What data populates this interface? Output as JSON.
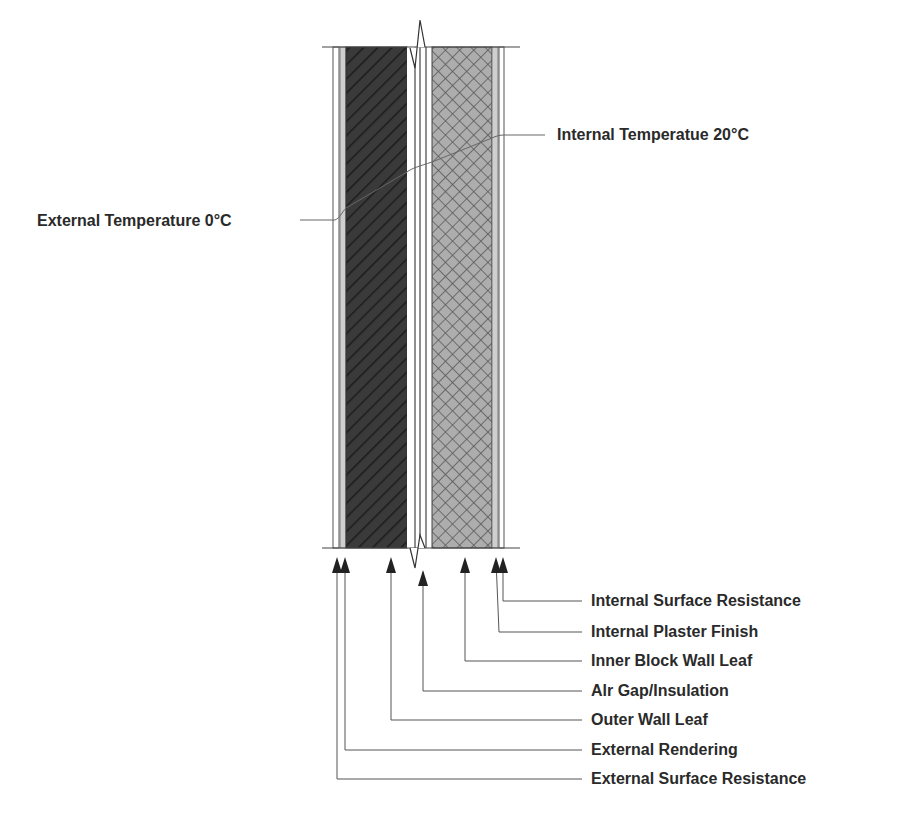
{
  "diagram": {
    "colors": {
      "outline": "#555555",
      "outer_leaf_fill": "#3a3a3a",
      "outer_leaf_hatch": "#222222",
      "inner_block_fill": "#a8a8a8",
      "inner_block_hatch": "#555555",
      "rendering_fill": "#cfcfcf",
      "plaster_fill": "#cfcfcf",
      "text": "#2a2a2a"
    },
    "temperatures": {
      "external": "External Temperature 0°C",
      "internal": "Internal Temperatue 20°C"
    },
    "layers": [
      {
        "label": "Internal Surface Resistance"
      },
      {
        "label": "Internal Plaster Finish"
      },
      {
        "label": "Inner Block Wall Leaf"
      },
      {
        "label": "Alr Gap/Insulation"
      },
      {
        "label": "Outer Wall Leaf"
      },
      {
        "label": "External Rendering"
      },
      {
        "label": "External Surface Resistance"
      }
    ]
  }
}
